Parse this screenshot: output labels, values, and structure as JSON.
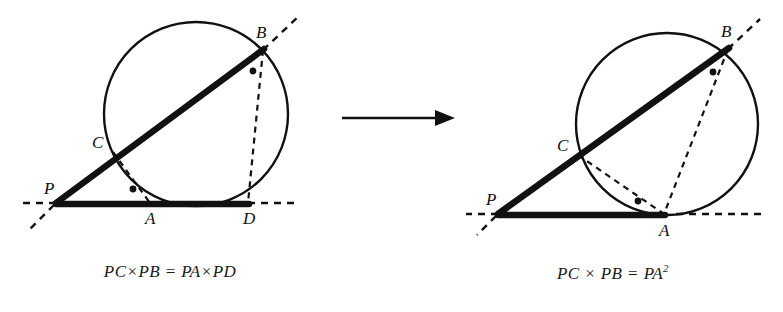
{
  "figure": {
    "type": "geometry-diagram",
    "stroke_color": "#111111",
    "background_color": "#ffffff"
  },
  "arrow": {
    "name": "transformation-arrow",
    "direction": "right",
    "x1": 12,
    "y1": 23,
    "x2": 112,
    "y2": 23
  },
  "panels": [
    {
      "id": "left",
      "caption_parts": {
        "lhs1": "PC",
        "op1": "×",
        "lhs2": "PB",
        "eq": "=",
        "rhs1": "PA",
        "op2": "×",
        "rhs2": "PD",
        "exp": ""
      },
      "caption_text": "PC×PB = PA×PD",
      "circle": {
        "cx": 196,
        "cy": 114,
        "r": 92
      },
      "points": [
        {
          "name": "P",
          "label": "P",
          "x": 56,
          "y": 203,
          "label_dx": -6,
          "label_dy": -10
        },
        {
          "name": "A",
          "label": "A",
          "x": 150,
          "y": 203,
          "label_dx": -3,
          "label_dy": 20
        },
        {
          "name": "B",
          "label": "B",
          "x": 263,
          "y": 50,
          "label_dx": -4,
          "label_dy": -12
        },
        {
          "name": "C",
          "label": "C",
          "x": 113,
          "y": 152,
          "label_dx": -18,
          "label_dy": -6
        },
        {
          "name": "D",
          "label": "D",
          "x": 248,
          "y": 203,
          "label_dx": -4,
          "label_dy": 20
        }
      ],
      "solid_segments": [
        {
          "name": "secant-PB",
          "from": "P",
          "to": "B"
        },
        {
          "name": "secant-PD",
          "from": "P",
          "to": "D"
        }
      ],
      "dashed_segments": [
        {
          "name": "chord-CA",
          "from": "C",
          "to": "A"
        },
        {
          "name": "chord-BD",
          "from": "B",
          "to": "D"
        }
      ],
      "dashed_extensions": [
        {
          "name": "extension-beyond-B",
          "x1": 263,
          "y1": 50,
          "x2": 296,
          "y2": 19
        },
        {
          "name": "extension-beyond-D",
          "x1": 248,
          "y1": 203,
          "x2": 292,
          "y2": 203
        },
        {
          "name": "extension-before-P-line",
          "x1": 56,
          "y1": 203,
          "x2": 24,
          "y2": 203
        },
        {
          "name": "extension-before-P-secant",
          "x1": 56,
          "y1": 203,
          "x2": 30,
          "y2": 228
        }
      ],
      "angle_dots": [
        {
          "name": "angle-dot-at-B",
          "x": 253,
          "y": 70
        },
        {
          "name": "angle-dot-at-A",
          "x": 133,
          "y": 189
        }
      ]
    },
    {
      "id": "right",
      "caption_parts": {
        "lhs1": "PC",
        "op1": "×",
        "lhs2": "PB",
        "eq": "=",
        "rhs1": "PA",
        "op2": "",
        "rhs2": "",
        "exp": "2"
      },
      "caption_text": "PC × PB = PA²",
      "circle": {
        "cx": 667,
        "cy": 124,
        "r": 91
      },
      "points": [
        {
          "name": "P",
          "label": "P",
          "x": 498,
          "y": 214,
          "label_dx": -6,
          "label_dy": -10
        },
        {
          "name": "A",
          "label": "A",
          "x": 664,
          "y": 214,
          "label_dx": -3,
          "label_dy": 21
        },
        {
          "name": "B",
          "label": "B",
          "x": 728,
          "y": 49,
          "label_dx": -4,
          "label_dy": -12
        },
        {
          "name": "C",
          "label": "C",
          "x": 578,
          "y": 155,
          "label_dx": -18,
          "label_dy": -6
        }
      ],
      "solid_segments": [
        {
          "name": "secant-PB",
          "from": "P",
          "to": "B"
        },
        {
          "name": "tangent-PA",
          "from": "P",
          "to": "A"
        }
      ],
      "dashed_segments": [
        {
          "name": "chord-CA",
          "from": "C",
          "to": "A"
        },
        {
          "name": "chord-BA",
          "from": "B",
          "to": "A"
        }
      ],
      "dashed_extensions": [
        {
          "name": "extension-beyond-B",
          "x1": 728,
          "y1": 49,
          "x2": 757,
          "y2": 22
        },
        {
          "name": "extension-beyond-A",
          "x1": 664,
          "y1": 214,
          "x2": 760,
          "y2": 214
        },
        {
          "name": "extension-before-P-line",
          "x1": 498,
          "y1": 214,
          "x2": 468,
          "y2": 214
        },
        {
          "name": "extension-before-P-secant",
          "x1": 498,
          "y1": 214,
          "x2": 478,
          "y2": 233
        }
      ],
      "angle_dots": [
        {
          "name": "angle-dot-at-B",
          "x": 713,
          "y": 71
        },
        {
          "name": "angle-dot-at-A",
          "x": 638,
          "y": 201
        }
      ]
    }
  ]
}
